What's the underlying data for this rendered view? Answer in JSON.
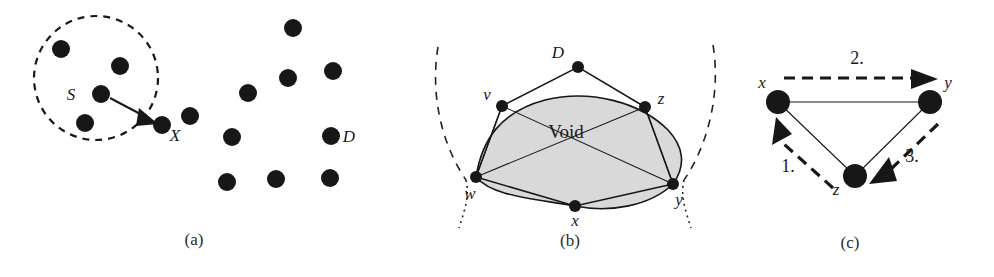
{
  "figure": {
    "background_color": "#ffffff",
    "dot_color": "#171717",
    "void_fill_color": "#d9d9d9",
    "line_color": "#171717"
  },
  "panel_a": {
    "caption": "(a)",
    "labels": {
      "source": "S",
      "target": "X",
      "destination": "D"
    },
    "dashed_circle": {
      "cx": 96,
      "cy": 78,
      "r": 62
    },
    "dots_in_circle": [
      {
        "cx": 61,
        "cy": 49,
        "r": 9
      },
      {
        "cx": 120,
        "cy": 66,
        "r": 9
      },
      {
        "cx": 101,
        "cy": 94,
        "r": 9
      },
      {
        "cx": 85,
        "cy": 123,
        "r": 9
      },
      {
        "cx": 162,
        "cy": 125,
        "r": 9
      }
    ],
    "dots_outside": [
      {
        "cx": 190,
        "cy": 116,
        "r": 9
      },
      {
        "cx": 293,
        "cy": 28,
        "r": 9
      },
      {
        "cx": 248,
        "cy": 93,
        "r": 9
      },
      {
        "cx": 288,
        "cy": 78,
        "r": 9
      },
      {
        "cx": 333,
        "cy": 71,
        "r": 9
      },
      {
        "cx": 232,
        "cy": 137,
        "r": 9
      },
      {
        "cx": 331,
        "cy": 136,
        "r": 9
      },
      {
        "cx": 227,
        "cy": 182,
        "r": 9
      },
      {
        "cx": 276,
        "cy": 179,
        "r": 9
      },
      {
        "cx": 330,
        "cy": 178,
        "r": 9
      }
    ],
    "arrow": {
      "x1": 110,
      "y1": 98,
      "x2": 156,
      "y2": 122
    }
  },
  "panel_b": {
    "caption": "(b)",
    "void_label": "Void",
    "labels": {
      "d": "D",
      "v": "v",
      "z": "z",
      "w": "w",
      "x": "x",
      "y": "y"
    },
    "vertices": [
      {
        "name": "D",
        "cx": 578,
        "cy": 67,
        "r": 6
      },
      {
        "name": "v",
        "cx": 502,
        "cy": 106,
        "r": 6
      },
      {
        "name": "z",
        "cx": 645,
        "cy": 107,
        "r": 6
      },
      {
        "name": "w",
        "cx": 476,
        "cy": 177,
        "r": 6
      },
      {
        "name": "x",
        "cx": 575,
        "cy": 206,
        "r": 6
      },
      {
        "name": "y",
        "cx": 673,
        "cy": 184,
        "r": 6
      }
    ]
  },
  "panel_c": {
    "caption": "(c)",
    "labels": {
      "x": "x",
      "y": "y",
      "z": "z"
    },
    "steps": [
      {
        "label": "1.",
        "from": "z",
        "to": "x"
      },
      {
        "label": "2.",
        "from": "x",
        "to": "y"
      },
      {
        "label": "3.",
        "from": "y",
        "to": "z"
      }
    ],
    "nodes": [
      {
        "name": "x",
        "cx": 778,
        "cy": 102,
        "r": 12
      },
      {
        "name": "y",
        "cx": 930,
        "cy": 102,
        "r": 12
      },
      {
        "name": "z",
        "cx": 855,
        "cy": 176,
        "r": 12
      }
    ]
  }
}
